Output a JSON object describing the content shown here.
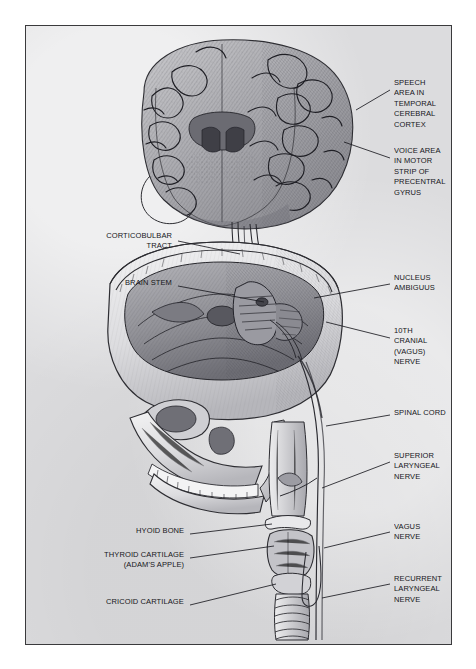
{
  "plate": {
    "title": "Neural pathways of speech and voice production",
    "style": "grayscale anatomical engraving",
    "frame_color": "#3a3a3c",
    "background_color": "#dcdcde",
    "ink_color": "#16161a"
  },
  "labels_right": [
    {
      "id": "speech-area",
      "text": "SPEECH\nAREA IN\nTEMPORAL\nCEREBRAL\nCORTEX",
      "x": 368,
      "y": 58,
      "line": [
        [
          364,
          64
        ],
        [
          330,
          84
        ]
      ]
    },
    {
      "id": "voice-area",
      "text": "VOICE AREA\nIN MOTOR\nSTRIP OF\nPRECENTRAL\nGYRUS",
      "x": 368,
      "y": 126,
      "line": [
        [
          364,
          132
        ],
        [
          318,
          116
        ]
      ]
    },
    {
      "id": "nucleus-ambiguus",
      "text": "NUCLEUS\nAMBIGUUS",
      "x": 368,
      "y": 252,
      "line": [
        [
          364,
          258
        ],
        [
          288,
          272
        ]
      ]
    },
    {
      "id": "vagus-10th",
      "text": "10TH\nCRANIAL\n(VAGUS)\nNERVE",
      "x": 368,
      "y": 306,
      "line": [
        [
          364,
          312
        ],
        [
          300,
          296
        ]
      ]
    },
    {
      "id": "spinal-cord",
      "text": "SPINAL CORD",
      "x": 368,
      "y": 385,
      "line": [
        [
          364,
          389
        ],
        [
          300,
          400
        ]
      ]
    },
    {
      "id": "superior-laryngeal",
      "text": "SUPERIOR\nLARYNGEAL\nNERVE",
      "x": 368,
      "y": 430,
      "line": [
        [
          364,
          436
        ],
        [
          300,
          462
        ]
      ]
    },
    {
      "id": "vagus-nerve",
      "text": "VAGUS\nNERVE",
      "x": 368,
      "y": 500,
      "line": [
        [
          364,
          506
        ],
        [
          300,
          522
        ]
      ]
    },
    {
      "id": "recurrent-laryngeal",
      "text": "RECURRENT\nLARYNGEAL\nNERVE",
      "x": 368,
      "y": 552,
      "line": [
        [
          364,
          558
        ],
        [
          300,
          570
        ]
      ]
    }
  ],
  "labels_left": [
    {
      "id": "corticobulbar-tract",
      "text": "CORTICOBULBAR\nTRACT",
      "x": 148,
      "y": 210,
      "line": [
        [
          152,
          215
        ],
        [
          214,
          228
        ]
      ]
    },
    {
      "id": "brain-stem",
      "text": "BRAIN STEM",
      "x": 148,
      "y": 256,
      "line": [
        [
          152,
          260
        ],
        [
          238,
          276
        ]
      ]
    },
    {
      "id": "hyoid-bone",
      "text": "HYOID BONE",
      "x": 160,
      "y": 504,
      "line": [
        [
          164,
          508
        ],
        [
          246,
          498
        ]
      ]
    },
    {
      "id": "thyroid-cartilage",
      "text": "THYROID CARTILAGE\n(ADAM'S APPLE)",
      "x": 160,
      "y": 528,
      "line": [
        [
          164,
          532
        ],
        [
          248,
          522
        ]
      ]
    },
    {
      "id": "cricoid-cartilage",
      "text": "CRICOID CARTILAGE",
      "x": 160,
      "y": 575,
      "line": [
        [
          164,
          579
        ],
        [
          248,
          556
        ]
      ]
    }
  ],
  "anatomy_parts": [
    "cerebral hemisphere coronal section",
    "corticobulbar tract fibers",
    "skull with calvaria removed",
    "cranial base and brainstem",
    "facial skeleton and mandible with teeth",
    "hyoid bone",
    "thyroid cartilage",
    "cricoid cartilage",
    "trachea with cartilage rings",
    "vagus nerve trunk",
    "recurrent laryngeal nerve loop"
  ]
}
